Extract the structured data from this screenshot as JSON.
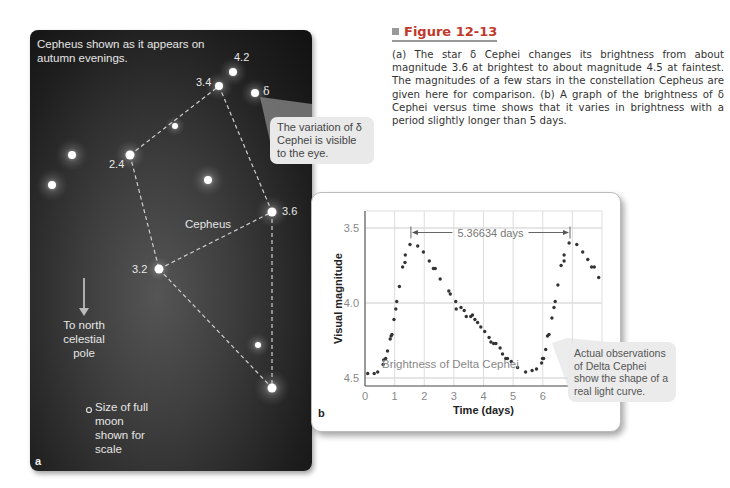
{
  "figure": {
    "title": "Figure 12-13",
    "caption": "(a) The star δ Cephei changes its brightness from about magnitude 3.6 at brightest to about magnitude 4.5 at faintest. The magnitudes of a few stars in the constellation Cepheus are given here for comparison. (b) A graph of the brightness of δ Cephei versus time shows that it varies in brightness with a period slightly longer than 5 days.",
    "title_color": "#c0392b"
  },
  "panel_a": {
    "letter": "a",
    "header": "Cepheus shown as it appears on autumn evenings.",
    "constellation_label": "Cepheus",
    "north_arrow_label": "To north celestial pole",
    "moon_note": "Size of full moon shown for scale",
    "callout": "The variation of δ Cephei is visible to the eye.",
    "star_labels": [
      {
        "text": "4.2"
      },
      {
        "text": "3.4"
      },
      {
        "text": "δ"
      },
      {
        "text": "2.4"
      },
      {
        "text": "3.6"
      },
      {
        "text": "3.2"
      }
    ]
  },
  "panel_b": {
    "letter": "b",
    "inner_label": "Brightness of Delta Cephei",
    "period_label": "5.36634 days",
    "callout": "Actual observations of Delta Cephei show the shape of a real light curve."
  },
  "chart_data": {
    "type": "scatter",
    "title": "Brightness of Delta Cephei",
    "xlabel": "Time (days)",
    "ylabel": "Visual magnitude",
    "xlim": [
      0,
      8
    ],
    "ylim": [
      4.5,
      3.4
    ],
    "y_inverted": true,
    "x_ticks": [
      "0",
      "1",
      "2",
      "3",
      "4",
      "5",
      "6",
      "7",
      "8"
    ],
    "y_ticks": [
      "3.5",
      "4.0",
      "4.5"
    ],
    "grid": true,
    "annotations": [
      {
        "type": "period-arrow",
        "x_start": 1.55,
        "x_end": 6.92,
        "y": 3.53,
        "label": "5.36634 days"
      }
    ],
    "series": [
      {
        "name": "Delta Cephei observations",
        "x": [
          0.09,
          0.31,
          0.43,
          0.61,
          0.63,
          0.7,
          0.76,
          0.85,
          0.88,
          0.91,
          0.98,
          1.04,
          1.07,
          1.16,
          1.27,
          1.35,
          1.36,
          1.52,
          1.78,
          1.97,
          2.17,
          2.31,
          2.37,
          2.54,
          2.83,
          2.88,
          3.06,
          3.08,
          3.24,
          3.35,
          3.42,
          3.57,
          3.63,
          3.71,
          3.8,
          3.91,
          4.04,
          4.19,
          4.25,
          4.34,
          4.42,
          4.56,
          4.64,
          4.75,
          4.81,
          4.94,
          5.15,
          5.42,
          5.64,
          5.79,
          5.96,
          5.99,
          6.03,
          6.1,
          6.16,
          6.21,
          6.31,
          6.38,
          6.42,
          6.51,
          6.62,
          6.72,
          6.72,
          6.89,
          7.15,
          7.35,
          7.52,
          7.65,
          7.74,
          7.89
        ],
        "y": [
          4.47,
          4.47,
          4.46,
          4.41,
          4.38,
          4.37,
          4.32,
          4.24,
          4.22,
          4.21,
          4.11,
          4.04,
          3.99,
          3.89,
          3.76,
          3.73,
          3.68,
          3.61,
          3.62,
          3.66,
          3.72,
          3.77,
          3.77,
          3.84,
          3.92,
          3.94,
          3.99,
          4.04,
          4.03,
          4.05,
          4.09,
          4.09,
          4.08,
          4.11,
          4.13,
          4.16,
          4.19,
          4.23,
          4.26,
          4.27,
          4.27,
          4.3,
          4.34,
          4.37,
          4.37,
          4.39,
          4.43,
          4.46,
          4.45,
          4.44,
          4.4,
          4.37,
          4.37,
          4.31,
          4.22,
          4.21,
          4.1,
          4.03,
          3.99,
          3.88,
          3.75,
          3.72,
          3.68,
          3.6,
          3.61,
          3.66,
          3.71,
          3.76,
          3.76,
          3.83
        ]
      }
    ]
  }
}
